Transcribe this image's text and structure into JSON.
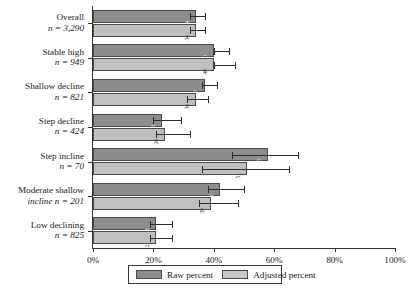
{
  "chart_data": {
    "type": "bar",
    "title": "",
    "xlabel": "",
    "ylabel": "",
    "orientation": "horizontal",
    "grid": false,
    "xlim": [
      0,
      100
    ],
    "xticks": [
      0,
      20,
      40,
      60,
      80,
      100
    ],
    "xtick_labels": [
      "0%",
      "20%",
      "40%",
      "60%",
      "80%",
      "100%"
    ],
    "legend_position": "bottom",
    "categories": [
      {
        "name": "Overall",
        "n_label": "n = 3,290"
      },
      {
        "name": "Stable high",
        "n_label": "n = 949"
      },
      {
        "name": "Shallow decline",
        "n_label": "n = 821"
      },
      {
        "name": "Step decline",
        "n_label": "n = 424"
      },
      {
        "name": "Step incline",
        "n_label": "n = 70"
      },
      {
        "name": "Moderate shallow",
        "n_label": "incline n = 201"
      },
      {
        "name": "Low declining",
        "n_label": "n = 825"
      }
    ],
    "series": [
      {
        "name": "Raw percent",
        "color": "#8d8d8d",
        "values": [
          34,
          40,
          37,
          23,
          58,
          42,
          21
        ],
        "labels": [
          "34",
          "40",
          "37",
          "23",
          "58",
          "42",
          "21"
        ],
        "err_low": [
          32,
          40,
          36,
          20,
          46,
          38,
          19
        ],
        "err_high": [
          37,
          45,
          41,
          29,
          68,
          50,
          26
        ]
      },
      {
        "name": "Adjusted percent",
        "color": "#bfbfbf",
        "values": [
          34,
          40,
          34,
          24,
          51,
          39,
          21
        ],
        "labels": [
          "34",
          "40",
          "34",
          "24",
          "51",
          "39",
          "21"
        ],
        "err_low": [
          32,
          40,
          31,
          21,
          36,
          35,
          19
        ],
        "err_high": [
          37,
          47,
          38,
          32,
          65,
          48,
          26
        ]
      }
    ]
  },
  "legend": {
    "raw_label": "Raw percent",
    "adjusted_label": "Adjusted percent"
  }
}
